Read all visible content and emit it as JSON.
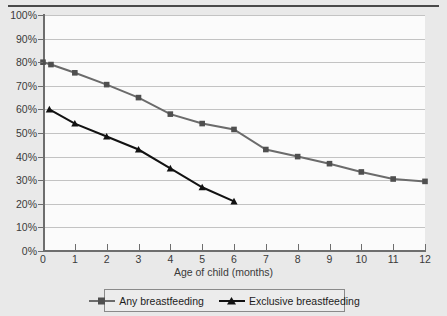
{
  "chart_data": {
    "type": "line",
    "title": "",
    "subtitle": "",
    "xlabel": "Age of child (months)",
    "ylabel": "",
    "xlim": [
      0,
      12
    ],
    "ylim": [
      0,
      100
    ],
    "grid": true,
    "legend_position": "bottom",
    "x_ticks": [
      "0",
      "1",
      "2",
      "3",
      "4",
      "5",
      "6",
      "7",
      "8",
      "9",
      "10",
      "11",
      "12"
    ],
    "x_tick_values": [
      0,
      1,
      2,
      3,
      4,
      5,
      6,
      7,
      8,
      9,
      10,
      11,
      12
    ],
    "y_ticks": [
      "0%",
      "10%",
      "20%",
      "30%",
      "40%",
      "50%",
      "60%",
      "70%",
      "80%",
      "90%",
      "100%"
    ],
    "y_tick_values": [
      0,
      10,
      20,
      30,
      40,
      50,
      60,
      70,
      80,
      90,
      100
    ],
    "series": [
      {
        "name": "Any breastfeeding",
        "color": "#6b6b6b",
        "marker": "square",
        "x": [
          0,
          0.25,
          1,
          2,
          3,
          4,
          5,
          6,
          7,
          8,
          9,
          10,
          11,
          12
        ],
        "values": [
          80,
          79,
          75.5,
          70.5,
          65,
          58,
          54,
          51.5,
          43,
          40,
          37,
          33.5,
          30.5,
          29.5
        ]
      },
      {
        "name": "Exclusive breastfeeding",
        "color": "#121212",
        "marker": "triangle",
        "x": [
          0.2,
          1,
          2,
          3,
          4,
          5,
          6
        ],
        "values": [
          60,
          54,
          48.5,
          43,
          35,
          27,
          21
        ]
      }
    ]
  },
  "legend": {
    "items": [
      {
        "label": "Any breastfeeding",
        "marker": "square-marker-icon",
        "color": "#6b6b6b"
      },
      {
        "label": "Exclusive breastfeeding",
        "marker": "triangle-marker-icon",
        "color": "#121212"
      }
    ]
  }
}
